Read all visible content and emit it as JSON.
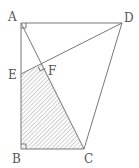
{
  "diagram": {
    "type": "geometry",
    "points": {
      "A": {
        "label": "A",
        "x": 21,
        "y": 23
      },
      "D": {
        "label": "D",
        "x": 122,
        "y": 23
      },
      "B": {
        "label": "B",
        "x": 21,
        "y": 149
      },
      "C": {
        "label": "C",
        "x": 84,
        "y": 149
      },
      "E": {
        "label": "E",
        "x": 21,
        "y": 74
      },
      "F": {
        "label": "F",
        "x": 43,
        "y": 64
      }
    },
    "segments": [
      "AD",
      "AB",
      "BC",
      "CD",
      "AC",
      "DE"
    ],
    "right_angles": [
      "A",
      "B",
      "F"
    ],
    "shaded_region": [
      "E",
      "B",
      "C",
      "F"
    ],
    "colors": {
      "line": "#777777",
      "hatch": "#888888",
      "label": "#555555"
    }
  }
}
